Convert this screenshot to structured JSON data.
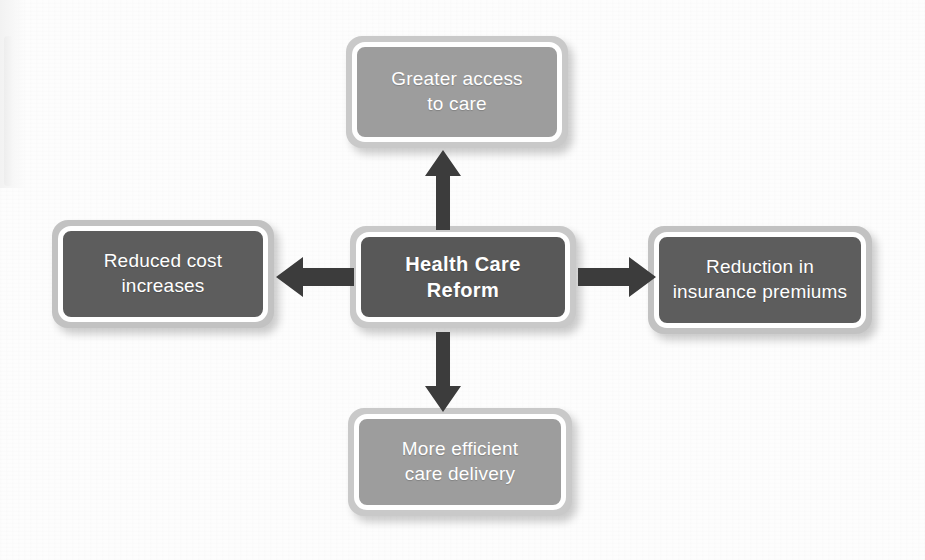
{
  "diagram": {
    "type": "hub-and-spoke",
    "title": "Health Care Reform",
    "center": {
      "id": "health-care-reform",
      "label": "Health Care Reform",
      "style": "dark",
      "bold": true,
      "fill": "#585858",
      "border": "#ffffff"
    },
    "nodes": [
      {
        "id": "greater-access",
        "position": "top",
        "line1": "Greater access",
        "line2": "to care",
        "style": "light",
        "fill": "#9d9d9d"
      },
      {
        "id": "reduced-cost-increases",
        "position": "left",
        "line1": "Reduced cost",
        "line2": "increases",
        "style": "dark",
        "fill": "#5d5d5d"
      },
      {
        "id": "reduction-insurance-premiums",
        "position": "right",
        "line1": "Reduction in",
        "line2": "insurance premiums",
        "style": "dark",
        "fill": "#5d5d5d"
      },
      {
        "id": "more-efficient-care-delivery",
        "position": "bottom",
        "line1": "More efficient",
        "line2": "care delivery",
        "style": "light",
        "fill": "#9d9d9d"
      }
    ],
    "arrows": [
      {
        "id": "arrow-up",
        "from": "health-care-reform",
        "to": "greater-access",
        "direction": "up",
        "color": "#3c3c3c"
      },
      {
        "id": "arrow-left",
        "from": "health-care-reform",
        "to": "reduced-cost-increases",
        "direction": "left",
        "color": "#3c3c3c"
      },
      {
        "id": "arrow-right",
        "from": "health-care-reform",
        "to": "reduction-insurance-premiums",
        "direction": "right",
        "color": "#3c3c3c"
      },
      {
        "id": "arrow-down",
        "from": "health-care-reform",
        "to": "more-efficient-care-delivery",
        "direction": "down",
        "color": "#3c3c3c"
      }
    ],
    "colors": {
      "background": "#fdfdfd",
      "arrow": "#3c3c3c",
      "text": "#ffffff",
      "outer_ring": "#c6c6c6",
      "fill_light": "#9d9d9d",
      "fill_dark": "#5d5d5d",
      "fill_center": "#585858"
    }
  }
}
